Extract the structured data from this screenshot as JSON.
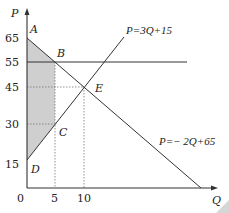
{
  "diagram": {
    "title": "",
    "axes": {
      "y_label": "P",
      "x_label": "Q",
      "origin_label": "0",
      "y_ticks": [
        "65",
        "55",
        "45",
        "30",
        "15"
      ],
      "x_ticks": [
        "5",
        "10"
      ]
    },
    "points": {
      "A": "A",
      "B": "B",
      "C": "C",
      "D": "D",
      "E": "E"
    },
    "curves": {
      "supply": "P=3Q+15",
      "demand": "P=− 2Q+65",
      "price_floor": "P=55"
    },
    "shaded_region": "A-B-C-D",
    "colors": {
      "line": "#333333",
      "shade": "#cfcfcf",
      "dotted": "#666666"
    }
  }
}
